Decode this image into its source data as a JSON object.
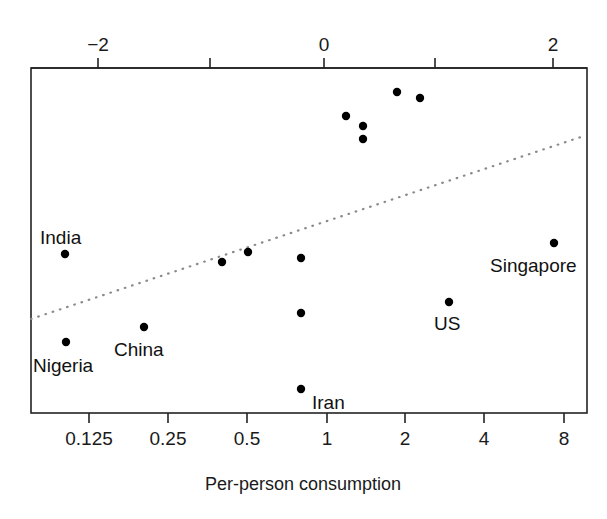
{
  "chart_data": {
    "type": "scatter",
    "title": "",
    "xlabel": "Per-person consumption",
    "ylabel": "",
    "grid": false,
    "legend": "none",
    "axes": {
      "bottom": {
        "label": "Per-person consumption",
        "scale": "log2",
        "tick_labels": [
          "0.125",
          "0.25",
          "0.5",
          "1",
          "2",
          "4",
          "8"
        ],
        "tick_values": [
          0.125,
          0.25,
          0.5,
          1,
          2,
          4,
          8
        ],
        "tick_px": [
          89,
          168,
          247,
          327,
          405,
          484,
          564
        ]
      },
      "top": {
        "label": "",
        "scale": "log",
        "tick_labels": [
          "-2",
          "",
          "0",
          "",
          "2"
        ],
        "tick_values": [
          -2,
          -1,
          0,
          1,
          2
        ],
        "tick_px": [
          98,
          210,
          324,
          435,
          553
        ],
        "labeled": [
          "-2",
          "0",
          "2"
        ]
      }
    },
    "plot_box_px": {
      "left": 31,
      "top": 68,
      "right": 587,
      "bottom": 413
    },
    "fit_line": {
      "style": "dotted",
      "x1_px": 31,
      "y1_px": 319,
      "x2_px": 581,
      "y2_px": 137
    },
    "points": [
      {
        "label": "India",
        "x_px": 65,
        "y_px": 254,
        "x_log": -2.18,
        "x_value": 0.11
      },
      {
        "label": "Nigeria",
        "x_px": 66,
        "y_px": 342,
        "x_log": -2.17,
        "x_value": 0.11
      },
      {
        "label": "China",
        "x_px": 144,
        "y_px": 327,
        "x_log": -1.48,
        "x_value": 0.22
      },
      {
        "label": "",
        "x_px": 222,
        "y_px": 262,
        "x_log": -0.79,
        "x_value": 0.42
      },
      {
        "label": "",
        "x_px": 248,
        "y_px": 252,
        "x_log": -0.56,
        "x_value": 0.5
      },
      {
        "label": "",
        "x_px": 301,
        "y_px": 258,
        "x_log": -0.09,
        "x_value": 0.79
      },
      {
        "label": "",
        "x_px": 301,
        "y_px": 313,
        "x_log": -0.09,
        "x_value": 0.79
      },
      {
        "label": "Iran",
        "x_px": 301,
        "y_px": 389,
        "x_log": -0.09,
        "x_value": 0.79
      },
      {
        "label": "",
        "x_px": 346,
        "y_px": 116,
        "x_log": 0.31,
        "x_value": 1.18
      },
      {
        "label": "",
        "x_px": 363,
        "y_px": 126,
        "x_log": 0.46,
        "x_value": 1.35
      },
      {
        "label": "",
        "x_px": 363,
        "y_px": 139,
        "x_log": 0.46,
        "x_value": 1.35
      },
      {
        "label": "",
        "x_px": 397,
        "y_px": 92,
        "x_log": 0.77,
        "x_value": 1.73
      },
      {
        "label": "",
        "x_px": 420,
        "y_px": 98,
        "x_log": 0.97,
        "x_value": 2.04
      },
      {
        "label": "US",
        "x_px": 449,
        "y_px": 302,
        "x_log": 1.23,
        "x_value": 2.97
      },
      {
        "label": "Singapore",
        "x_px": 554,
        "y_px": 243,
        "x_log": 2.17,
        "x_value": 7.5
      }
    ],
    "point_labels": [
      {
        "text": "India",
        "x_px": 40,
        "y_px": 244,
        "anchor": "start"
      },
      {
        "text": "Nigeria",
        "x_px": 33,
        "y_px": 372,
        "anchor": "start"
      },
      {
        "text": "China",
        "x_px": 114,
        "y_px": 356,
        "anchor": "start"
      },
      {
        "text": "Iran",
        "x_px": 312,
        "y_px": 409,
        "anchor": "start"
      },
      {
        "text": "US",
        "x_px": 434,
        "y_px": 330,
        "anchor": "start"
      },
      {
        "text": "Singapore",
        "x_px": 490,
        "y_px": 272,
        "anchor": "start"
      }
    ],
    "marker": {
      "shape": "circle",
      "radius_px": 4.2,
      "color": "#000000"
    },
    "colors": {
      "background": "#ffffff",
      "axis": "#222222",
      "marker": "#000000",
      "fit_line": "#7a7a7a",
      "text": "#1a1a1a"
    }
  }
}
